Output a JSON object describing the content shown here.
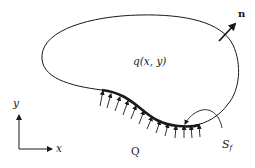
{
  "diagram": {
    "type": "heat-flux-boundary-domain",
    "colors": {
      "stroke": "#1a1a1a",
      "background": "#ffffff"
    },
    "labels": {
      "domain_source": "q(x, y)",
      "normal_vector": "n",
      "boundary_flux": "Q",
      "boundary_segment_main": "S",
      "boundary_segment_sub": "f",
      "axis_x": "x",
      "axis_y": "y"
    },
    "elements": [
      {
        "name": "domain-outline",
        "description": "closed curved region boundary"
      },
      {
        "name": "flux-boundary",
        "description": "thick boundary segment with incoming flux arrows"
      },
      {
        "name": "normal-arrow",
        "description": "outward unit normal arrow labeled n"
      },
      {
        "name": "segment-pointer",
        "description": "curved arrow pointing to boundary segment S_f"
      },
      {
        "name": "coordinate-axes",
        "description": "x-y axes in lower left"
      }
    ]
  }
}
